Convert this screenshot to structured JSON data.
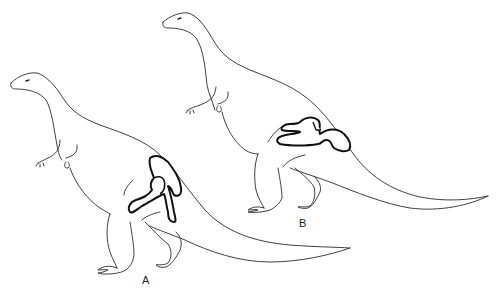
{
  "figure": {
    "panels": [
      {
        "label": "A",
        "subject": "dinosaur-outline-with-pelvis-upright-ilium"
      },
      {
        "label": "B",
        "subject": "dinosaur-outline-with-pelvis-elongated"
      }
    ],
    "colors": {
      "background": "#ffffff",
      "outline": "#2a2a2a",
      "pelvis": "#111111"
    }
  }
}
